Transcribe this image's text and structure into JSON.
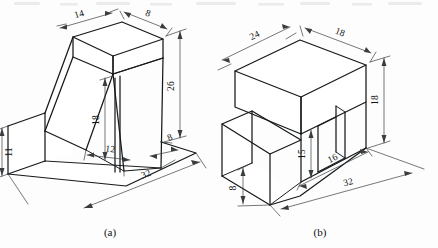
{
  "sheet": {
    "width": 438,
    "height": 248,
    "background": "#fdfdfd",
    "line_color": "#16181a",
    "dim_color": "#3a3d40"
  },
  "figures": [
    {
      "id": "figure-a",
      "caption": "(a)",
      "description": "Isometric view of a bracket with an inclined ramp face and a rectangular base plate",
      "dimensions": [
        {
          "name": "top-width",
          "value": "14",
          "position": "top-left-edge"
        },
        {
          "name": "top-depth",
          "value": "8",
          "position": "top-right-edge"
        },
        {
          "name": "overall-height",
          "value": "26",
          "position": "right-vertical"
        },
        {
          "name": "rib-height",
          "value": "18",
          "position": "center-vertical"
        },
        {
          "name": "base-front-height",
          "value": "11",
          "position": "left-vertical"
        },
        {
          "name": "rib-offset",
          "value": "12",
          "position": "bottom-center"
        },
        {
          "name": "rib-thickness",
          "value": "8",
          "position": "bottom-right"
        },
        {
          "name": "base-length",
          "value": "32",
          "position": "bottom-edge"
        }
      ]
    },
    {
      "id": "figure-b",
      "caption": "(b)",
      "description": "Isometric view of a stepped block with a rectangular through slot",
      "dimensions": [
        {
          "name": "top-length",
          "value": "24",
          "position": "top-left-edge"
        },
        {
          "name": "top-depth",
          "value": "18",
          "position": "top-right-edge"
        },
        {
          "name": "overall-height",
          "value": "18",
          "position": "right-vertical"
        },
        {
          "name": "slot-height",
          "value": "15",
          "position": "center-vertical"
        },
        {
          "name": "step-height",
          "value": "8",
          "position": "left-vertical"
        },
        {
          "name": "slot-offset",
          "value": "16",
          "position": "bottom-center"
        },
        {
          "name": "base-length",
          "value": "32",
          "position": "bottom-edge"
        }
      ]
    }
  ],
  "labels": {
    "fig_a_14": "14",
    "fig_a_8_top": "8",
    "fig_a_26": "26",
    "fig_a_18": "18",
    "fig_a_11": "11",
    "fig_a_12": "12",
    "fig_a_8_bottom": "8",
    "fig_a_32": "32",
    "fig_a_caption": "(a)",
    "fig_b_24": "24",
    "fig_b_18_top": "18",
    "fig_b_18_right": "18",
    "fig_b_15": "15",
    "fig_b_8": "8",
    "fig_b_16": "16",
    "fig_b_32": "32",
    "fig_b_caption": "(b)"
  }
}
